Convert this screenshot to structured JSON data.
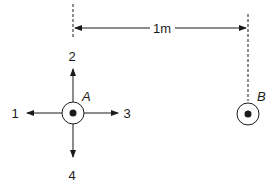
{
  "diagram": {
    "dimension": {
      "label": "1m"
    },
    "point_a": {
      "label": "A",
      "directions": [
        {
          "id": "1",
          "label": "1",
          "direction": "left"
        },
        {
          "id": "2",
          "label": "2",
          "direction": "up"
        },
        {
          "id": "3",
          "label": "3",
          "direction": "right"
        },
        {
          "id": "4",
          "label": "4",
          "direction": "down"
        }
      ]
    },
    "point_b": {
      "label": "B"
    },
    "colors": {
      "stroke": "#1a1a1a",
      "background": "#ffffff"
    }
  }
}
